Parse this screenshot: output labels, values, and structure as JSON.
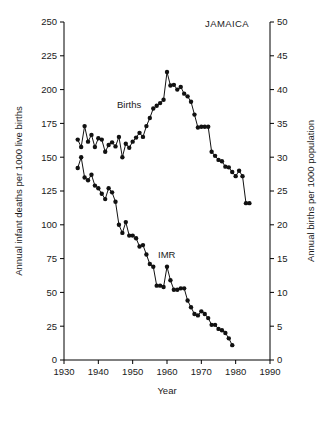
{
  "chart_data": {
    "type": "line",
    "title": "JAMAICA",
    "xlabel": "Year",
    "ylabel": "Annual infant deaths per 1000 live births",
    "ylabel_right": "Annual births per 1000 population",
    "xlim": [
      1930,
      1990
    ],
    "ylim": [
      0,
      250
    ],
    "ylim_right": [
      0,
      50
    ],
    "xticks": [
      1930,
      1940,
      1950,
      1960,
      1970,
      1980,
      1990
    ],
    "xticklabels": [
      "1930",
      "1940",
      "1950",
      "1960",
      "1970",
      "1980",
      "1990"
    ],
    "yticks": [
      0,
      25,
      50,
      75,
      100,
      125,
      150,
      175,
      200,
      225,
      250
    ],
    "yticklabels": [
      "0",
      "25",
      "50",
      "75",
      "100",
      "125",
      "150",
      "175",
      "200",
      "225",
      "250"
    ],
    "yticks_right": [
      0,
      5,
      10,
      15,
      20,
      25,
      30,
      35,
      40,
      45,
      50
    ],
    "yticklabels_right": [
      "0",
      "5",
      "10",
      "15",
      "20",
      "25",
      "30",
      "35",
      "40",
      "45",
      "50"
    ],
    "grid": false,
    "legend_position": "inline-annotations",
    "markers": "filled-circle",
    "series": [
      {
        "name": "Births",
        "axis": "right",
        "units": "annual births per 1000 population",
        "label_annotation": "Births",
        "x": [
          1934,
          1935,
          1936,
          1937,
          1938,
          1939,
          1940,
          1941,
          1942,
          1943,
          1944,
          1945,
          1946,
          1947,
          1948,
          1949,
          1950,
          1951,
          1952,
          1953,
          1954,
          1955,
          1956,
          1957,
          1958,
          1959,
          1960,
          1961,
          1962,
          1963,
          1964,
          1965,
          1966,
          1967,
          1968,
          1969,
          1970,
          1971,
          1972,
          1973,
          1974,
          1975,
          1976,
          1977,
          1978,
          1979,
          1980,
          1981,
          1982,
          1983,
          1984
        ],
        "values": [
          32.6,
          31.5,
          34.6,
          32.3,
          33.3,
          31.5,
          32.8,
          32.6,
          30.8,
          31.8,
          32.2,
          31.6,
          33.0,
          30.0,
          32.0,
          31.4,
          32.3,
          32.9,
          33.6,
          33.0,
          34.6,
          35.8,
          37.2,
          37.6,
          38.0,
          38.5,
          42.6,
          40.6,
          40.7,
          40.0,
          40.4,
          39.4,
          39.0,
          38.2,
          36.3,
          34.4,
          34.5,
          34.5,
          34.5,
          30.8,
          30.2,
          29.6,
          29.4,
          28.6,
          28.5,
          27.8,
          27.2,
          28.0,
          27.2,
          23.2,
          23.2
        ]
      },
      {
        "name": "IMR",
        "axis": "left",
        "units": "annual infant deaths per 1000 live births",
        "label_annotation": "IMR",
        "x": [
          1934,
          1935,
          1936,
          1937,
          1938,
          1939,
          1940,
          1941,
          1942,
          1943,
          1944,
          1945,
          1946,
          1947,
          1948,
          1949,
          1950,
          1951,
          1952,
          1953,
          1954,
          1955,
          1956,
          1957,
          1958,
          1959,
          1960,
          1961,
          1962,
          1963,
          1964,
          1965,
          1966,
          1967,
          1968,
          1969,
          1970,
          1971,
          1972,
          1973,
          1974,
          1975,
          1976,
          1977,
          1978,
          1979
        ],
        "values": [
          142,
          150,
          135,
          133,
          137,
          129,
          127,
          123,
          119,
          127,
          124,
          117,
          100,
          94,
          102,
          92,
          92,
          90,
          84,
          85,
          78,
          71,
          69,
          55,
          55,
          54,
          69,
          59,
          52,
          52,
          53,
          53,
          44,
          39,
          34,
          33,
          36,
          34,
          31,
          26,
          26,
          23,
          22,
          20,
          16,
          11
        ]
      }
    ],
    "annotations": [
      {
        "text": "Births",
        "x_px": 117,
        "y_px": 108
      },
      {
        "text": "IMR",
        "x_px": 158,
        "y_px": 258
      },
      {
        "text": "JAMAICA",
        "x_px": 205,
        "y_px": 27
      }
    ]
  },
  "colors": {
    "background": "#ffffff",
    "axis": "#000000",
    "marker": "#111111",
    "text": "#1a1a1a"
  }
}
